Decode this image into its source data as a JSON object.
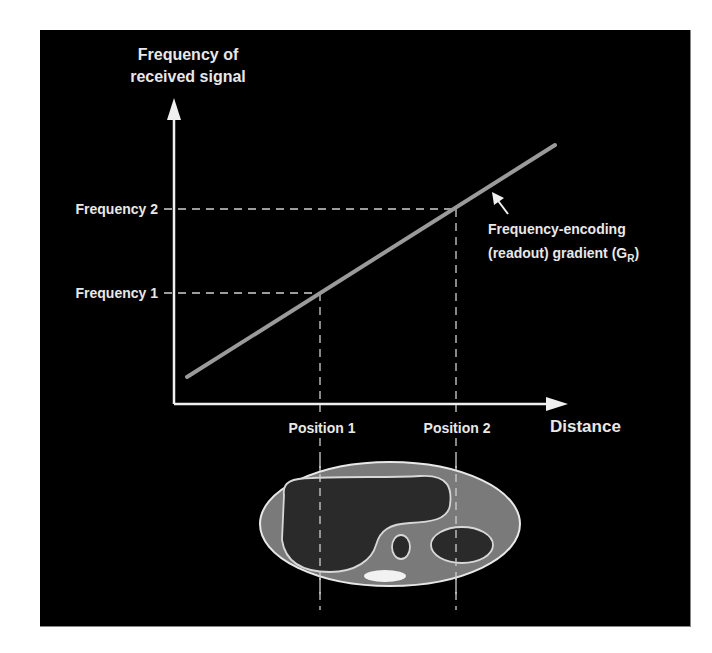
{
  "diagram": {
    "y_axis_label_line1": "Frequency of",
    "y_axis_label_line2": "received signal",
    "x_axis_label": "Distance",
    "frequency_2_label": "Frequency 2",
    "frequency_1_label": "Frequency 1",
    "position_1_label": "Position 1",
    "position_2_label": "Position 2",
    "gradient_label_line1": "Frequency-encoding",
    "gradient_label_line2_prefix": "(readout) gradient (G",
    "gradient_label_subscript": "R",
    "gradient_label_suffix": ")",
    "colors": {
      "background": "#000000",
      "axis": "#f0f0f0",
      "gradient_line": "#9a9a9a",
      "body_fill": "#7a7a7a",
      "organ_fill": "#2a2a2a",
      "outline": "#e0e0e0",
      "bright_spot": "#f2f2f2"
    }
  }
}
